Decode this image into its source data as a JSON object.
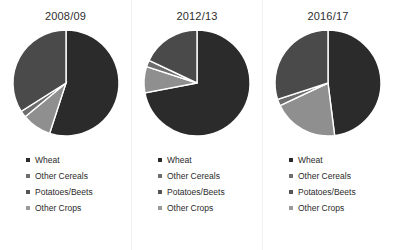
{
  "figure": {
    "background": "#ffffff",
    "panel_divider_color": "#f1f1f1"
  },
  "series_colors": {
    "wheat": "#2b2b2b",
    "other_cereals": "#8f8f8f",
    "potatoes_beets": "#6e6e6e",
    "other_crops": "#4a4a4a",
    "separator": "#ffffff"
  },
  "legend": {
    "items": [
      {
        "label": "Wheat",
        "marker": "square-marker",
        "color": "#2b2b2b"
      },
      {
        "label": "Other Cereals",
        "marker": "square-marker",
        "color": "#6e6e6e"
      },
      {
        "label": "Potatoes/Beets",
        "marker": "square-marker",
        "color": "#555555"
      },
      {
        "label": "Other Crops",
        "marker": "square-marker",
        "color": "#9a9a9a"
      }
    ]
  },
  "panels": [
    {
      "title": "2008/09"
    },
    {
      "title": "2012/13"
    },
    {
      "title": "2016/17"
    }
  ],
  "chart_data": [
    {
      "type": "pie",
      "title": "2008/09",
      "labels": [
        "Wheat",
        "Other Cereals",
        "Potatoes/Beets",
        "Other Crops"
      ],
      "values": [
        55,
        9,
        2,
        34
      ],
      "unit": "percent",
      "start_angle_deg": 0,
      "direction": "clockwise",
      "legend_position": "bottom-left",
      "grid": false
    },
    {
      "type": "pie",
      "title": "2012/13",
      "labels": [
        "Wheat",
        "Other Cereals",
        "Potatoes/Beets",
        "Other Crops"
      ],
      "values": [
        72,
        8,
        2,
        18
      ],
      "unit": "percent",
      "start_angle_deg": 0,
      "direction": "clockwise",
      "legend_position": "bottom-left",
      "grid": false
    },
    {
      "type": "pie",
      "title": "2016/17",
      "labels": [
        "Wheat",
        "Other Cereals",
        "Potatoes/Beets",
        "Other Crops"
      ],
      "values": [
        48,
        20,
        2,
        30
      ],
      "unit": "percent",
      "start_angle_deg": 0,
      "direction": "clockwise",
      "legend_position": "bottom-left",
      "grid": false
    }
  ]
}
